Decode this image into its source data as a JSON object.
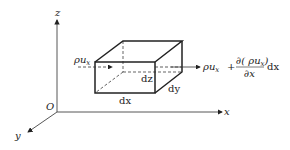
{
  "diagram": {
    "title": "",
    "axes": {
      "origin_label": "O",
      "x_label": "x",
      "y_label": "y",
      "z_label": "z"
    },
    "box": {
      "edge_labels": {
        "dx": "dx",
        "dy": "dy",
        "dz": "dz"
      }
    },
    "inflow": {
      "rho": "ρu",
      "sub": "x"
    },
    "outflow": {
      "rho": "ρu",
      "sub": "x",
      "plus": "+",
      "numerator": "∂( ρu",
      "numerator_sub": "x",
      "numerator_close": ")",
      "denominator": "∂x",
      "trailing": "dx"
    },
    "colors": {
      "line": "#222222",
      "background": "#ffffff"
    }
  }
}
